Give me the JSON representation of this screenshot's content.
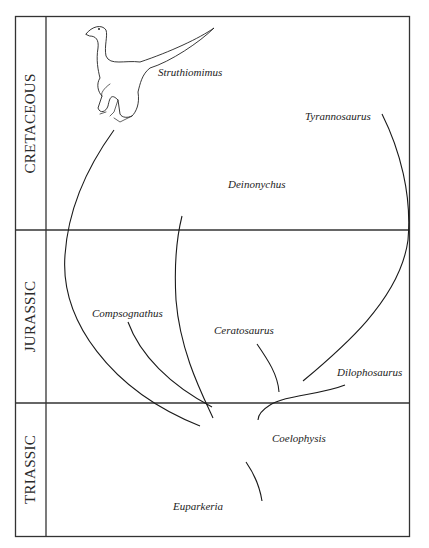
{
  "diagram": {
    "type": "phylogeny",
    "eras": [
      {
        "name": "CRETACEOUS",
        "position": "top"
      },
      {
        "name": "JURASSIC",
        "position": "middle"
      },
      {
        "name": "TRIASSIC",
        "position": "bottom"
      }
    ],
    "species": [
      {
        "name": "Struthiomimus",
        "era": "CRETACEOUS"
      },
      {
        "name": "Tyrannosaurus",
        "era": "CRETACEOUS"
      },
      {
        "name": "Deinonychus",
        "era": "CRETACEOUS"
      },
      {
        "name": "Compsognathus",
        "era": "JURASSIC"
      },
      {
        "name": "Ceratosaurus",
        "era": "JURASSIC"
      },
      {
        "name": "Dilophosaurus",
        "era": "JURASSIC"
      },
      {
        "name": "Coelophysis",
        "era": "TRIASSIC"
      },
      {
        "name": "Euparkeria",
        "era": "TRIASSIC"
      }
    ],
    "edges": [
      {
        "from": "Euparkeria",
        "to": "Coelophysis"
      },
      {
        "from": "Coelophysis",
        "to": "Struthiomimus"
      },
      {
        "from": "Coelophysis",
        "to": "Deinonychus"
      },
      {
        "from": "Coelophysis",
        "to": "Compsognathus"
      },
      {
        "from": "Coelophysis",
        "to": "Ceratosaurus"
      },
      {
        "from": "Coelophysis",
        "to": "Dilophosaurus"
      },
      {
        "from": "Ceratosaurus",
        "to": "Tyrannosaurus"
      }
    ]
  }
}
